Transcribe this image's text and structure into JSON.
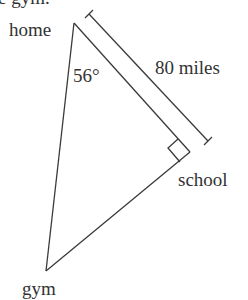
{
  "top_partial_text": "e gym.",
  "vertices": {
    "home": {
      "label": "home",
      "x": 74,
      "y": 23
    },
    "school": {
      "label": "school",
      "x": 190,
      "y": 152
    },
    "gym": {
      "label": "gym",
      "x": 46,
      "y": 271
    }
  },
  "angle_label": "56°",
  "distance_label": "80 miles",
  "colors": {
    "line": "#3a3a3a",
    "text": "#333333",
    "background": "#ffffff"
  }
}
